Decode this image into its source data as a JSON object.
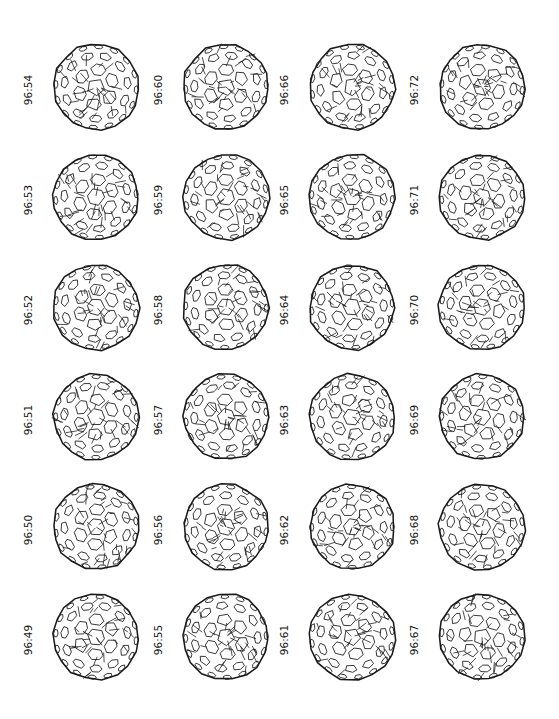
{
  "figure": {
    "columns": [
      {
        "isomers": [
          "96:54",
          "96:53",
          "96:52",
          "96:51",
          "96:50",
          "96:49"
        ]
      },
      {
        "isomers": [
          "96:60",
          "96:59",
          "96:58",
          "96:57",
          "96:56",
          "96:55"
        ]
      },
      {
        "isomers": [
          "96:66",
          "96:65",
          "96:64",
          "96:63",
          "96:62",
          "96:61"
        ]
      },
      {
        "isomers": [
          "96:72",
          "96:71",
          "96:70",
          "96:69",
          "96:68",
          "96:67"
        ]
      }
    ]
  },
  "colors": {
    "line": "#1a1a1a",
    "background": "#ffffff"
  }
}
